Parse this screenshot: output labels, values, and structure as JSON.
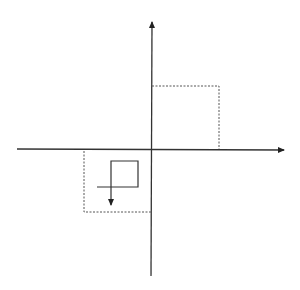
{
  "diagram": {
    "type": "coordinate-plane-transformation",
    "colors": {
      "background": "#ffffff",
      "axis": "#333333",
      "dotted": "#555555",
      "path": "#333333"
    },
    "axes": {
      "x_axis": {
        "from": [
          17,
          149
        ],
        "to": [
          284,
          150
        ],
        "arrow": "right"
      },
      "y_axis": {
        "from": [
          151,
          276
        ],
        "to": [
          152,
          22
        ],
        "arrow": "up"
      }
    },
    "dotted_rects": [
      {
        "name": "upper-right-rect",
        "x1": 152,
        "y1": 86,
        "x2": 219,
        "y2": 149
      },
      {
        "name": "lower-left-rect",
        "x1": 84,
        "y1": 150,
        "x2": 151,
        "y2": 212
      }
    ],
    "spiral_path": {
      "points": [
        [
          97,
          187
        ],
        [
          138,
          187
        ],
        [
          138,
          161
        ],
        [
          111,
          161
        ],
        [
          111,
          205
        ]
      ],
      "arrow": "down"
    }
  }
}
